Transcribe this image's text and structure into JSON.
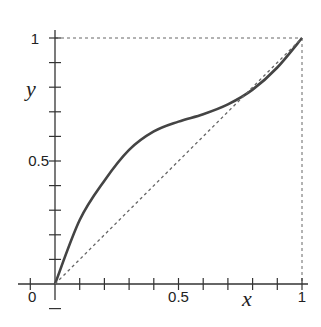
{
  "chart_data": {
    "type": "line",
    "title": "",
    "xlabel": "x",
    "ylabel": "y",
    "xlim": [
      0,
      1
    ],
    "ylim": [
      0,
      1
    ],
    "grid": false,
    "x_ticks": {
      "labels": [
        "0",
        "0.5",
        "1"
      ],
      "minor_step": 0.1
    },
    "y_ticks": {
      "labels": [
        "0.5",
        "1"
      ],
      "minor_step": 0.1
    },
    "series": [
      {
        "name": "curve",
        "style": "solid",
        "color": "#444444",
        "x": [
          0,
          0.1,
          0.2,
          0.3,
          0.4,
          0.5,
          0.6,
          0.7,
          0.8,
          0.9,
          1.0
        ],
        "values": [
          0,
          0.26,
          0.42,
          0.545,
          0.62,
          0.66,
          0.69,
          0.73,
          0.79,
          0.88,
          1.0
        ]
      },
      {
        "name": "diagonal y=x",
        "style": "dashed",
        "color": "#666666",
        "x": [
          0,
          1
        ],
        "values": [
          0,
          1
        ]
      }
    ],
    "reference_lines": [
      {
        "type": "horizontal",
        "y": 1,
        "style": "dashed"
      },
      {
        "type": "vertical",
        "x": 1,
        "style": "dashed"
      }
    ]
  }
}
